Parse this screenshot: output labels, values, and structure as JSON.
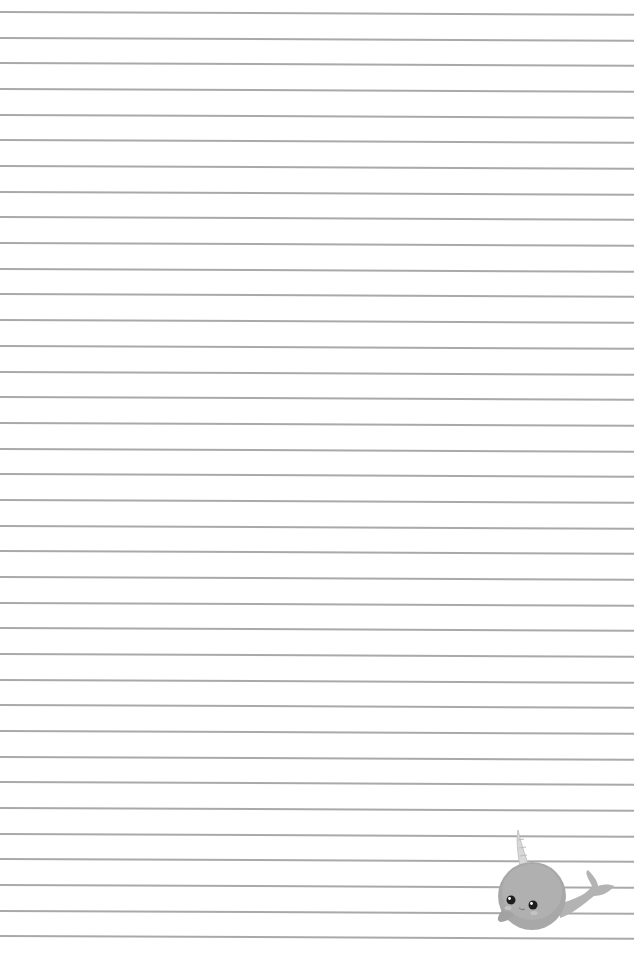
{
  "page": {
    "type": "lined-paper",
    "background_color": "#ffffff",
    "line_color": "#a9a9a9",
    "line_count": 37,
    "first_line_y": 11,
    "line_spacing": 25.68,
    "line_width": 634
  },
  "decoration": {
    "icon": "narwhal-icon",
    "style": "grayscale"
  }
}
